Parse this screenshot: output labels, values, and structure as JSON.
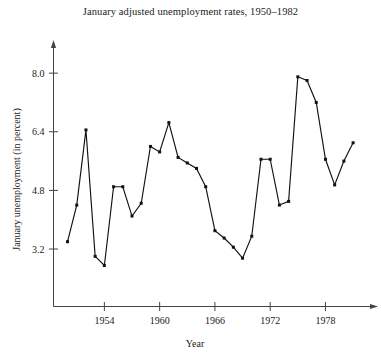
{
  "chart_data": {
    "type": "line",
    "title": "January adjusted unemployment rates, 1950–1982",
    "xlabel": "Year",
    "ylabel": "January unemployment (in percent)",
    "xlim": [
      1949.4,
      1982.4
    ],
    "ylim": [
      2.3,
      8.55
    ],
    "grid": false,
    "legend": null,
    "marker": "filled-square",
    "xticks": [
      1954,
      1960,
      1966,
      1972,
      1978
    ],
    "xtick_labels": [
      "1954",
      "1960",
      "1966",
      "1972",
      "1978"
    ],
    "yticks": [
      3.2,
      4.8,
      6.4,
      8.0
    ],
    "ytick_labels": [
      "3.2",
      "4.8",
      "6.4",
      "8.0"
    ],
    "x": [
      1950,
      1951,
      1952,
      1953,
      1954,
      1955,
      1956,
      1957,
      1958,
      1959,
      1960,
      1961,
      1962,
      1963,
      1964,
      1965,
      1966,
      1967,
      1968,
      1969,
      1970,
      1971,
      1972,
      1973,
      1974,
      1975,
      1976,
      1977,
      1978,
      1979,
      1980,
      1981
    ],
    "values": [
      3.4,
      4.4,
      6.45,
      3.0,
      2.75,
      4.9,
      4.9,
      4.1,
      4.45,
      6.0,
      5.85,
      6.65,
      5.7,
      5.55,
      5.4,
      4.9,
      3.7,
      3.5,
      3.25,
      2.95,
      3.55,
      5.65,
      5.65,
      4.4,
      4.5,
      7.9,
      7.8,
      7.2,
      5.65,
      4.95,
      5.6,
      6.1
    ],
    "axis_color": "#444444",
    "line_color": "#111111",
    "marker_color": "#111111"
  }
}
